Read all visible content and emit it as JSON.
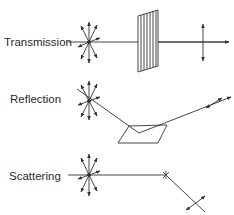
{
  "diagram": {
    "title": "",
    "rows": [
      {
        "id": "transmission",
        "label": "Transmission",
        "element": "stacked polarizer plates",
        "output": "vertically polarized (linear)"
      },
      {
        "id": "reflection",
        "label": "Reflection",
        "element": "reflecting surface (parallelogram)",
        "output": "polarized reflected beam"
      },
      {
        "id": "scattering",
        "label": "Scattering",
        "element": "scattering particle",
        "output": "polarized scattered beam"
      }
    ],
    "colors": {
      "line": "#333333",
      "background": "#ffffff",
      "text": "#2a2a2a"
    }
  }
}
